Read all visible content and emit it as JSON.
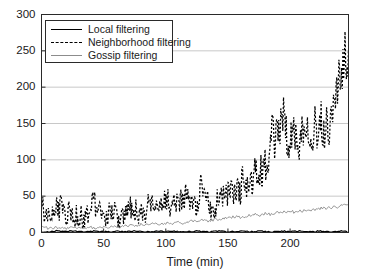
{
  "chart_data": {
    "type": "line",
    "title": "",
    "xlabel": "Time (min)",
    "ylabel": "",
    "xlim": [
      0,
      247
    ],
    "ylim": [
      0,
      300
    ],
    "xticks": [
      0,
      50,
      100,
      150,
      200
    ],
    "yticks": [
      0,
      50,
      100,
      150,
      200,
      250,
      300
    ],
    "grid": "horizontal",
    "legend_position": "upper-left",
    "colors": {
      "local": "#000000",
      "neighborhood": "#000000",
      "gossip": "#8c8c8c",
      "grid": "#c8c8c8",
      "axis": "#2a2a2a"
    },
    "series": [
      {
        "name": "Local filtering",
        "style": "solid",
        "color": "#000000",
        "x": [
          0,
          6,
          12,
          18,
          25,
          31,
          37,
          43,
          50,
          56,
          62,
          68,
          75,
          81,
          87,
          93,
          100,
          106,
          112,
          118,
          125,
          131,
          137,
          143,
          150,
          156,
          162,
          168,
          175,
          181,
          187,
          193,
          200,
          206,
          212,
          218,
          225,
          231,
          237,
          243,
          247
        ],
        "values": [
          1,
          1,
          2,
          1,
          2,
          1,
          1,
          2,
          1,
          1,
          2,
          1,
          2,
          1,
          1,
          2,
          1,
          2,
          1,
          1,
          2,
          1,
          1,
          2,
          1,
          1,
          2,
          1,
          2,
          1,
          1,
          2,
          1,
          2,
          1,
          1,
          2,
          1,
          1,
          2,
          1
        ]
      },
      {
        "name": "Neighborhood filtering",
        "style": "dashed",
        "color": "#000000",
        "x": [
          0,
          2,
          4,
          6,
          8,
          10,
          12,
          14,
          16,
          18,
          20,
          22,
          24,
          26,
          28,
          30,
          32,
          34,
          36,
          38,
          40,
          42,
          44,
          46,
          48,
          50,
          52,
          54,
          56,
          58,
          60,
          62,
          64,
          66,
          68,
          70,
          72,
          74,
          76,
          78,
          80,
          82,
          84,
          86,
          88,
          90,
          92,
          94,
          96,
          98,
          100,
          102,
          104,
          106,
          108,
          110,
          112,
          114,
          116,
          118,
          120,
          122,
          124,
          126,
          128,
          130,
          132,
          134,
          136,
          138,
          140,
          142,
          144,
          146,
          148,
          150,
          152,
          154,
          156,
          158,
          160,
          162,
          164,
          166,
          168,
          170,
          172,
          174,
          176,
          178,
          180,
          182,
          184,
          186,
          188,
          190,
          192,
          194,
          196,
          198,
          200,
          202,
          204,
          206,
          208,
          210,
          212,
          214,
          216,
          218,
          220,
          222,
          224,
          226,
          228,
          230,
          232,
          234,
          236,
          238,
          240,
          242,
          244,
          246,
          247
        ],
        "values": [
          50,
          24,
          30,
          18,
          34,
          22,
          40,
          28,
          45,
          30,
          20,
          34,
          22,
          16,
          28,
          18,
          26,
          14,
          30,
          20,
          38,
          50,
          30,
          22,
          36,
          24,
          18,
          30,
          20,
          34,
          24,
          16,
          28,
          20,
          40,
          26,
          36,
          22,
          32,
          18,
          26,
          34,
          22,
          46,
          30,
          38,
          26,
          42,
          30,
          50,
          36,
          44,
          28,
          40,
          48,
          32,
          46,
          36,
          55,
          42,
          38,
          50,
          34,
          44,
          72,
          52,
          40,
          46,
          28,
          20,
          36,
          48,
          56,
          44,
          60,
          52,
          68,
          58,
          46,
          64,
          56,
          78,
          66,
          58,
          74,
          62,
          86,
          70,
          90,
          76,
          96,
          82,
          118,
          140,
          120,
          155,
          135,
          170,
          150,
          130,
          118,
          146,
          126,
          138,
          120,
          150,
          132,
          160,
          140,
          128,
          150,
          136,
          162,
          148,
          136,
          158,
          144,
          170,
          200,
          185,
          230,
          210,
          240,
          220,
          250
        ]
      },
      {
        "name": "Gossip filtering",
        "style": "solid-thin",
        "color": "#8c8c8c",
        "x": [
          0,
          5,
          10,
          15,
          20,
          25,
          30,
          35,
          40,
          45,
          50,
          55,
          60,
          65,
          70,
          75,
          80,
          85,
          90,
          95,
          100,
          105,
          110,
          115,
          120,
          125,
          130,
          135,
          140,
          145,
          150,
          155,
          160,
          165,
          170,
          175,
          180,
          185,
          190,
          195,
          200,
          205,
          210,
          215,
          220,
          225,
          230,
          235,
          240,
          245,
          247
        ],
        "values": [
          8,
          6,
          7,
          5,
          6,
          7,
          6,
          5,
          7,
          6,
          8,
          7,
          9,
          8,
          10,
          9,
          11,
          10,
          12,
          11,
          13,
          12,
          14,
          13,
          15,
          16,
          17,
          16,
          18,
          19,
          20,
          22,
          21,
          23,
          25,
          24,
          26,
          25,
          27,
          28,
          29,
          28,
          30,
          31,
          32,
          33,
          34,
          35,
          36,
          37,
          38
        ]
      }
    ]
  },
  "axes": {
    "xticklabels": [
      "0",
      "50",
      "100",
      "150",
      "200"
    ],
    "yticklabels": [
      "0",
      "50",
      "100",
      "150",
      "200",
      "250",
      "300"
    ],
    "xlabel": "Time (min)"
  },
  "legend": {
    "items": [
      {
        "label": "Local filtering",
        "style": "solid"
      },
      {
        "label": "Neighborhood filtering",
        "style": "dashed"
      },
      {
        "label": "Gossip filtering",
        "style": "gossip"
      }
    ]
  }
}
